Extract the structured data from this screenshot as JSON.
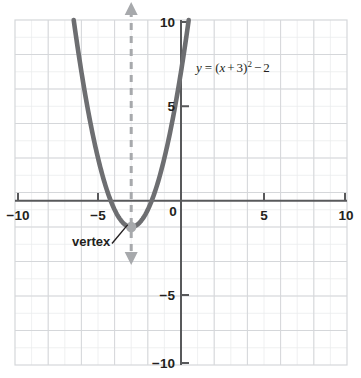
{
  "chart_data": {
    "type": "line",
    "title": "",
    "xlabel": "",
    "ylabel": "",
    "xlim": [
      -10,
      10
    ],
    "ylim": [
      -10,
      10
    ],
    "grid": true,
    "grid_minor_step": 1,
    "grid_major_step": 2,
    "legend": "none",
    "x_ticks": [
      -10,
      -5,
      0,
      5,
      10
    ],
    "x_tick_labels": [
      "−10",
      "−5",
      "0",
      "5",
      "10"
    ],
    "y_ticks": [
      -10,
      -5,
      0,
      5,
      10
    ],
    "y_tick_labels": [
      "−10",
      "−5",
      "0",
      "5",
      "10"
    ],
    "series": [
      {
        "name": "parabola",
        "equation": "y = (x + 3)^2 - 2",
        "color": "#6d6e71",
        "vertex": [
          -3,
          -2
        ],
        "x": [
          -6.5,
          -6.0,
          -5.5,
          -5.0,
          -4.5,
          -4.0,
          -3.5,
          -3.0,
          -2.5,
          -2.0,
          -1.5,
          -1.0,
          -0.55
        ],
        "y": [
          10.25,
          7.0,
          4.25,
          2.0,
          0.25,
          -1.0,
          -1.75,
          -2.0,
          -1.75,
          -1.0,
          0.25,
          2.0,
          3.99
        ]
      }
    ],
    "annotations": [
      {
        "name": "axis-of-symmetry",
        "type": "dashed-double-arrow-vline",
        "x": -3,
        "color": "#a7a9ac"
      },
      {
        "name": "vertex-point",
        "type": "point",
        "x": -3,
        "y": -2,
        "color": "#a7a9ac"
      },
      {
        "name": "vertex-callout",
        "type": "text-with-leader",
        "text": "vertex",
        "point": [
          -3,
          -2
        ]
      },
      {
        "name": "equation-label",
        "type": "text",
        "text": "y = (x + 3)2 − 2",
        "x": 0.6,
        "y": 7.2
      }
    ]
  },
  "labels": {
    "x_neg10": "−10",
    "x_neg5": "−5",
    "x_zero": "0",
    "x_5": "5",
    "x_10": "10",
    "y_10": "10",
    "y_5": "5",
    "y_neg5": "−5",
    "y_neg10": "−10",
    "vertex": "vertex"
  },
  "equation": {
    "lhs": "y",
    "eq": "=",
    "open": "(",
    "var": "x",
    "plus": "+",
    "three": "3",
    "close": ")",
    "exponent": "2",
    "minus": "−",
    "two": "2"
  },
  "colors": {
    "curve": "#6d6e71",
    "annotation": "#a7a9ac",
    "axis": "#58595b",
    "grid_minor": "#e9eaec",
    "grid_major": "#d7d9dc",
    "text": "#231f20"
  }
}
